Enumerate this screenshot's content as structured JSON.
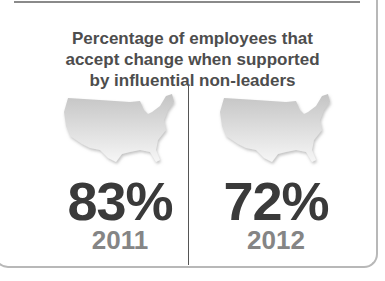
{
  "title": "Percentage of employees that accept change when supported by influential non-leaders",
  "title_lines": [
    "Percentage of employees that",
    "accept change when supported",
    "by influential non-leaders"
  ],
  "stats": [
    {
      "value": "83%",
      "year": "2011",
      "icon": "us-map-icon"
    },
    {
      "value": "72%",
      "year": "2012",
      "icon": "us-map-icon"
    }
  ],
  "colors": {
    "value_text": "#3a3a3a",
    "year_text": "#858585",
    "title_text": "#4d4d4d"
  }
}
